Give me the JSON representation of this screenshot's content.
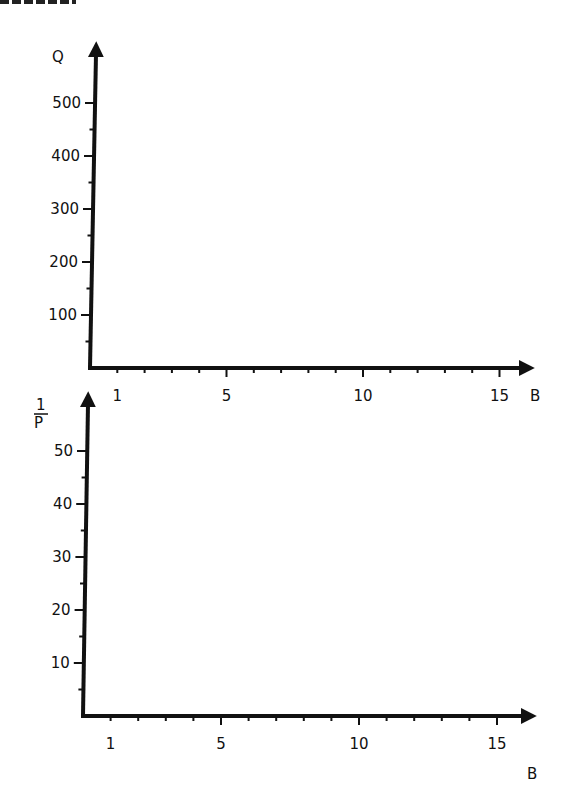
{
  "chart_data": [
    {
      "type": "line",
      "title": "",
      "xlabel": "B",
      "ylabel": "Q",
      "xlim": [
        0,
        16
      ],
      "ylim": [
        0,
        550
      ],
      "x_tick_labels": [
        "1",
        "5",
        "10",
        "15"
      ],
      "x_tick_values": [
        1,
        5,
        10,
        15
      ],
      "x_minor_tick_step": 1,
      "y_tick_labels": [
        "100",
        "200",
        "300",
        "400",
        "500"
      ],
      "y_tick_values": [
        100,
        200,
        300,
        400,
        500
      ],
      "y_minor_tick_step": 50,
      "grid": false,
      "series": []
    },
    {
      "type": "line",
      "title": "",
      "xlabel": "B",
      "ylabel": "1/P",
      "xlim": [
        0,
        16
      ],
      "ylim": [
        0,
        55
      ],
      "x_tick_labels": [
        "1",
        "5",
        "10",
        "15"
      ],
      "x_tick_values": [
        1,
        5,
        10,
        15
      ],
      "x_minor_tick_step": 1,
      "y_tick_labels": [
        "10",
        "20",
        "30",
        "40",
        "50"
      ],
      "y_tick_values": [
        10,
        20,
        30,
        40,
        50
      ],
      "y_minor_tick_step": 5,
      "grid": false,
      "series": []
    }
  ],
  "top_plot": {
    "y_axis_label": "Q",
    "x_axis_label": "B",
    "y_ticks": [
      "100",
      "200",
      "300",
      "400",
      "500"
    ],
    "x_ticks": [
      "1",
      "5",
      "10",
      "15"
    ]
  },
  "bottom_plot": {
    "y_axis_label_numerator": "1",
    "y_axis_label_denominator": "P",
    "x_axis_label": "B",
    "y_ticks": [
      "10",
      "20",
      "30",
      "40",
      "50"
    ],
    "x_ticks": [
      "1",
      "5",
      "10",
      "15"
    ]
  },
  "colors": {
    "ink": "#111111",
    "background": "#ffffff"
  }
}
